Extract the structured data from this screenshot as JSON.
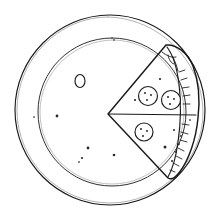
{
  "artwork": {
    "title": "Hand-drawn pizza with one slice separated",
    "style": "black ink line sketch on white background",
    "background_color": "#ffffff",
    "ink_color": "#1a1a1a",
    "faint_ink_color": "#5b5b5b",
    "width": 213,
    "height": 219
  },
  "shapes": {
    "outer_crust_circle": {
      "name": "outer-crust-circle",
      "cx": 110,
      "cy": 110,
      "rx": 95,
      "ry": 95
    },
    "inner_cheese_circle": {
      "name": "inner-cheese-circle",
      "cx": 112,
      "cy": 112,
      "rx": 74,
      "ry": 74
    },
    "slice": {
      "name": "pizza-slice",
      "apex": {
        "x": 108,
        "y": 114
      },
      "top_corner": {
        "x": 166,
        "y": 45
      },
      "bottom_corner": {
        "x": 168,
        "y": 178
      },
      "crust_outer_right_x": 198,
      "cut_line": {
        "x1": 108,
        "y1": 114,
        "x2": 196,
        "y2": 114
      }
    }
  },
  "toppings": {
    "pepperoni": [
      {
        "label": "pepperoni-1",
        "cx": 148,
        "cy": 96,
        "r": 9.5
      },
      {
        "label": "pepperoni-2",
        "cx": 171,
        "cy": 100,
        "r": 9.5
      },
      {
        "label": "pepperoni-3",
        "cx": 144,
        "cy": 132,
        "r": 9.0
      }
    ],
    "olive_ring": {
      "label": "olive-ring",
      "cx": 80,
      "cy": 81,
      "rx": 5.0,
      "ry": 6.5
    },
    "specks": [
      {
        "cx": 114,
        "cy": 40,
        "r": 0.9
      },
      {
        "cx": 160,
        "cy": 79,
        "r": 1.1
      },
      {
        "cx": 135,
        "cy": 100,
        "r": 1.1
      },
      {
        "cx": 165,
        "cy": 147,
        "r": 1.5
      },
      {
        "cx": 174,
        "cy": 130,
        "r": 1.0
      },
      {
        "cx": 190,
        "cy": 120,
        "r": 1.0
      },
      {
        "cx": 57,
        "cy": 116,
        "r": 1.4
      },
      {
        "cx": 34,
        "cy": 117,
        "r": 0.9
      },
      {
        "cx": 88,
        "cy": 148,
        "r": 1.4
      },
      {
        "cx": 82,
        "cy": 158,
        "r": 1.1
      },
      {
        "cx": 114,
        "cy": 155,
        "r": 1.3
      },
      {
        "cx": 79,
        "cy": 162,
        "r": 1.0
      }
    ]
  },
  "crust_detail": {
    "name": "crust-hatching",
    "description": "short tick marks along the outer curved crust edge of the slice",
    "tick_count": 12
  },
  "labels": {
    "figure_caption": ""
  }
}
